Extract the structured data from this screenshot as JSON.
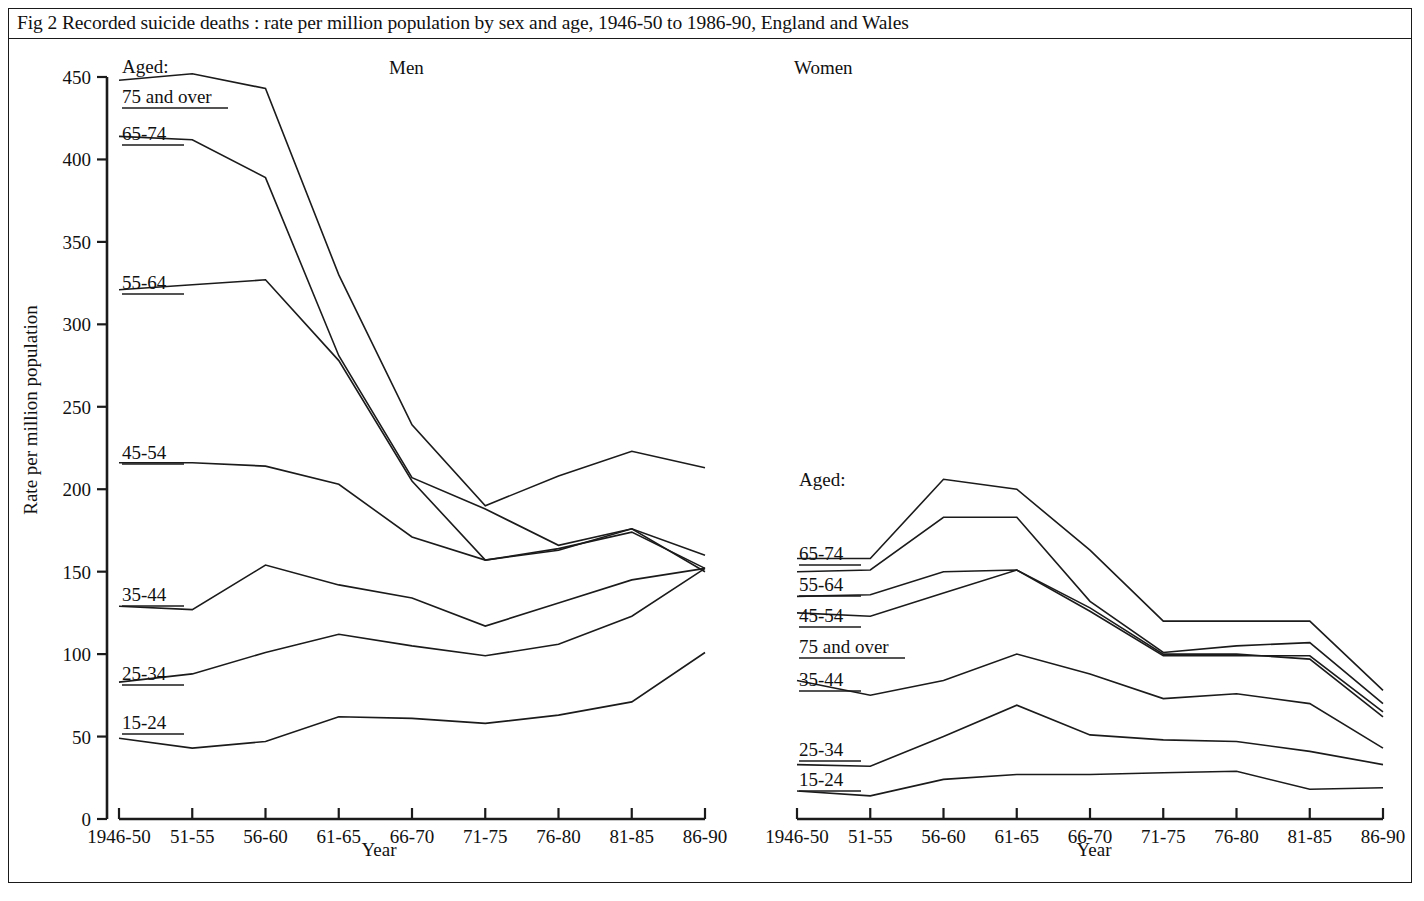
{
  "figure": {
    "caption": "Fig 2   Recorded suicide deaths : rate per million population by sex and age, 1946-50 to 1986-90, England and Wales",
    "y_axis_title": "Rate per million population",
    "x_axis_title_men": "Year",
    "x_axis_title_women": "Year",
    "legend_heading_men": "Aged:",
    "legend_heading_women": "Aged:",
    "panel_men_title": "Men",
    "panel_women_title": "Women",
    "line_color": "#1b1b1b",
    "background_color": "#ffffff"
  },
  "chart_data": [
    {
      "type": "line",
      "title": "Men",
      "xlabel": "Year",
      "ylabel": "Rate per million population",
      "ylim": [
        0,
        450
      ],
      "yticks": [
        0,
        50,
        100,
        150,
        200,
        250,
        300,
        350,
        400,
        450
      ],
      "grid": false,
      "legend": "inline-left-labels",
      "categories": [
        "1946-50",
        "51-55",
        "56-60",
        "61-65",
        "66-70",
        "71-75",
        "76-80",
        "81-85",
        "86-90"
      ],
      "series": [
        {
          "name": "75 and over",
          "values": [
            448,
            452,
            443,
            330,
            239,
            190,
            208,
            223,
            213
          ]
        },
        {
          "name": "65-74",
          "values": [
            414,
            412,
            389,
            281,
            207,
            188,
            166,
            176,
            150
          ]
        },
        {
          "name": "55-64",
          "values": [
            321,
            324,
            327,
            278,
            205,
            157,
            163,
            176,
            160
          ]
        },
        {
          "name": "45-54",
          "values": [
            216,
            216,
            214,
            203,
            171,
            157,
            164,
            174,
            152
          ]
        },
        {
          "name": "35-44",
          "values": [
            129,
            127,
            154,
            142,
            134,
            117,
            131,
            145,
            152
          ]
        },
        {
          "name": "25-34",
          "values": [
            83,
            88,
            101,
            112,
            105,
            99,
            106,
            123,
            152
          ]
        },
        {
          "name": "15-24",
          "values": [
            49,
            43,
            47,
            62,
            61,
            58,
            63,
            71,
            101
          ]
        }
      ]
    },
    {
      "type": "line",
      "title": "Women",
      "xlabel": "Year",
      "ylabel": "Rate per million population",
      "ylim": [
        0,
        450
      ],
      "yticks": [
        0,
        50,
        100,
        150,
        200,
        250,
        300,
        350,
        400,
        450
      ],
      "grid": false,
      "legend": "inline-left-labels",
      "categories": [
        "1946-50",
        "51-55",
        "56-60",
        "61-65",
        "66-70",
        "71-75",
        "76-80",
        "81-85",
        "86-90"
      ],
      "series": [
        {
          "name": "65-74",
          "values": [
            158,
            158,
            206,
            200,
            163,
            120,
            120,
            120,
            78
          ]
        },
        {
          "name": "55-64",
          "values": [
            150,
            151,
            183,
            183,
            132,
            101,
            105,
            107,
            70
          ]
        },
        {
          "name": "45-54",
          "values": [
            135,
            136,
            150,
            151,
            126,
            99,
            99,
            99,
            65
          ]
        },
        {
          "name": "75 and over",
          "values": [
            125,
            123,
            137,
            151,
            128,
            100,
            100,
            97,
            62
          ]
        },
        {
          "name": "35-44",
          "values": [
            84,
            75,
            84,
            100,
            88,
            73,
            76,
            70,
            43
          ]
        },
        {
          "name": "25-34",
          "values": [
            33,
            32,
            50,
            69,
            51,
            48,
            47,
            41,
            33
          ]
        },
        {
          "name": "15-24",
          "values": [
            17,
            14,
            24,
            27,
            27,
            28,
            29,
            18,
            19
          ]
        }
      ]
    }
  ],
  "men_labels": [
    {
      "text": "75 and over",
      "underline": true
    },
    {
      "text": "65-74",
      "underline": true
    },
    {
      "text": "55-64",
      "underline": true
    },
    {
      "text": "45-54",
      "underline": true
    },
    {
      "text": "35-44",
      "underline": true
    },
    {
      "text": "25-34",
      "underline": true
    },
    {
      "text": "15-24",
      "underline": true
    }
  ],
  "women_labels": [
    {
      "text": "65-74",
      "underline": true
    },
    {
      "text": "55-64",
      "underline": true
    },
    {
      "text": "45-54",
      "underline": true
    },
    {
      "text": "75 and over",
      "underline": true
    },
    {
      "text": "35-44",
      "underline": true
    },
    {
      "text": "25-34",
      "underline": true
    },
    {
      "text": "15-24",
      "underline": true
    }
  ]
}
